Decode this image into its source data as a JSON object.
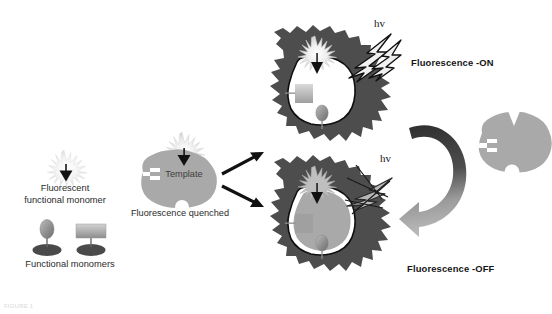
{
  "figure": {
    "caption_faint": "FIGURE 1"
  },
  "legend": {
    "fluorescent_monomer": {
      "label_line1": "Fluorescent",
      "label_line2": "functional monomer",
      "icon_burst": "starburst-icon",
      "icon_arrow": "down-triangle-icon"
    },
    "functional_monomers": {
      "label": "Functional monomers",
      "icon_oval": "oval-monomer-icon",
      "icon_square": "square-monomer-icon"
    }
  },
  "template_stage": {
    "label": "Template",
    "status": "Fluorescence quenched",
    "icon_burst": "starburst-icon",
    "icon_arrow": "down-triangle-icon"
  },
  "states": {
    "on": {
      "label": "Fluorescence -ON",
      "hv": "hv",
      "icon_bolt": "lightning-bolt-icon",
      "icon_burst": "starburst-icon",
      "icon_arrow": "down-triangle-icon",
      "icon_oval_monomer": "oval-monomer-icon",
      "icon_square_monomer": "square-monomer-icon"
    },
    "off": {
      "label": "Fluorescence -OFF",
      "hv": "hv",
      "icon_bolt": "blocked-lightning-bolt-icon",
      "icon_burst": "starburst-icon",
      "icon_arrow": "down-triangle-icon",
      "icon_oval_monomer": "oval-monomer-icon",
      "icon_square_monomer": "square-monomer-icon"
    }
  },
  "rebinding": {
    "icon_arrow": "curved-rebinding-arrow-icon",
    "icon_template": "template-blob-icon"
  },
  "arrows": {
    "split_up": "arrow-to-fluorescence-on",
    "split_down": "arrow-to-fluorescence-off"
  },
  "colors": {
    "polymer_dark": "#4d4d4d",
    "template_gray": "#a9a9a9",
    "cavity_white": "#ffffff",
    "burst_light": "#e3e3e3",
    "arrow_black": "#111111",
    "curved_arrow_dark": "#3a3a3a",
    "curved_arrow_light": "#b4b4b4",
    "monomer_base": "#4a4a4a",
    "background": "#ffffff"
  }
}
